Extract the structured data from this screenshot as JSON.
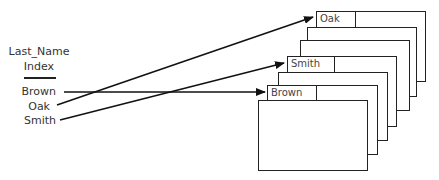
{
  "index": {
    "title_line1": "Last_Name",
    "title_line2": "Index",
    "entries": [
      "Brown",
      "Oak",
      "Smith"
    ]
  },
  "cards": {
    "oak_label": "Oak",
    "smith_label": "Smith",
    "brown_label": "Brown"
  }
}
